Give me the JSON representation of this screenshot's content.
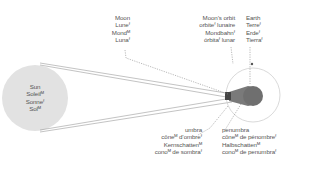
{
  "diagram": {
    "type": "lunar eclipse",
    "colors": {
      "sun_fill": "#e2e2e2",
      "earth_fill": "#6f6f6f",
      "orbit_stroke": "#cfcfcf",
      "ray_stroke": "#9a9a9a",
      "leader_stroke": "#8a8a8a",
      "text": "#555555"
    },
    "labels": {
      "sun": [
        "Sun",
        "Soleilᴹ",
        "Sonneᶠ",
        "Solᴹ"
      ],
      "moon": [
        "Moon",
        "Luneᶠ",
        "Mondᴹ",
        "Lunaᶠ"
      ],
      "moon_orbit": [
        "Moon’s orbit",
        "orbiteᶠ lunaire",
        "Mondbahnᶠ",
        "órbitaᶠ lunar"
      ],
      "earth": [
        "Earth",
        "Terreᶠ",
        "Erdeᶠ",
        "Tierraᶠ"
      ],
      "umbra": [
        "umbra",
        "côneᴹ d’ombreᶠ",
        "Kernschattenᴹ",
        "conoᴹ de sombraᶠ"
      ],
      "penumbra": [
        "penumbra",
        "côneᴹ de pénombreᶠ",
        "Halbschattenᴹ",
        "conoᴹ de penumbraᶠ"
      ]
    }
  }
}
